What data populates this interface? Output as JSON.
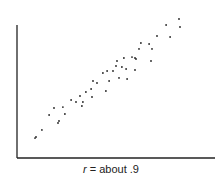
{
  "chart_data": {
    "type": "scatter",
    "title": "",
    "xlabel": "",
    "ylabel": "",
    "caption": {
      "variable": "r",
      "text": " = about .9"
    },
    "xlim": [
      0,
      100
    ],
    "ylim": [
      0,
      100
    ],
    "grid": false,
    "legend": "none",
    "tick_labels": {
      "x": [],
      "y": []
    },
    "point_color": "#222222",
    "axis_color": "#222222",
    "points": [
      [
        9.1,
        15.0
      ],
      [
        9.6,
        15.8
      ],
      [
        12.6,
        21.1
      ],
      [
        16.2,
        32.3
      ],
      [
        18.7,
        37.6
      ],
      [
        20.7,
        26.3
      ],
      [
        21.2,
        27.8
      ],
      [
        23.2,
        38.3
      ],
      [
        24.2,
        33.1
      ],
      [
        27.3,
        43.6
      ],
      [
        29.8,
        42.1
      ],
      [
        31.8,
        46.6
      ],
      [
        32.8,
        39.1
      ],
      [
        33.3,
        42.1
      ],
      [
        34.8,
        49.6
      ],
      [
        37.4,
        51.9
      ],
      [
        37.9,
        45.9
      ],
      [
        38.4,
        57.9
      ],
      [
        40.4,
        56.4
      ],
      [
        43.4,
        63.9
      ],
      [
        44.9,
        50.4
      ],
      [
        45.5,
        65.4
      ],
      [
        46.5,
        57.9
      ],
      [
        48.5,
        65.4
      ],
      [
        50.0,
        69.2
      ],
      [
        50.5,
        72.9
      ],
      [
        51.5,
        60.2
      ],
      [
        53.0,
        68.4
      ],
      [
        54.0,
        75.2
      ],
      [
        55.1,
        66.9
      ],
      [
        55.6,
        59.4
      ],
      [
        58.1,
        75.9
      ],
      [
        59.6,
        75.2
      ],
      [
        60.1,
        74.4
      ],
      [
        59.6,
        66.2
      ],
      [
        61.6,
        82.0
      ],
      [
        62.6,
        86.5
      ],
      [
        66.7,
        85.7
      ],
      [
        67.7,
        72.9
      ],
      [
        68.2,
        82.0
      ],
      [
        70.7,
        91.7
      ],
      [
        75.3,
        100.0
      ],
      [
        77.3,
        91.0
      ],
      [
        81.8,
        104.5
      ],
      [
        82.3,
        98.5
      ]
    ]
  }
}
